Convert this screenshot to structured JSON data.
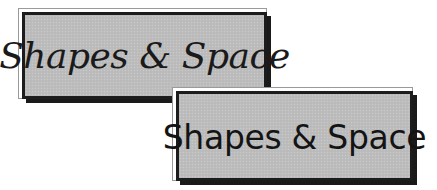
{
  "cards": [
    {
      "title": "Shapes & Space",
      "style": "italic-serif"
    },
    {
      "title": "Shapes & Space",
      "style": "sans-serif"
    }
  ],
  "colors": {
    "card_fill": "#bdbdbd",
    "border": "#1c1c1c",
    "shadow": "#1a1a1a",
    "outer_frame": "#9a9a9a",
    "background": "#ffffff",
    "text": "#1a1a1a"
  }
}
